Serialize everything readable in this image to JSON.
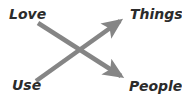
{
  "diagram": {
    "title_visible": false,
    "background_color": "#ffffff",
    "arrow_color": "#858585",
    "label_color": "#2b2b2b",
    "labels": [
      {
        "id": "love",
        "text": "Love",
        "position": "top-left"
      },
      {
        "id": "things",
        "text": "Things",
        "position": "top-right"
      },
      {
        "id": "use",
        "text": "Use",
        "position": "bottom-left"
      },
      {
        "id": "people",
        "text": "People",
        "position": "bottom-right"
      }
    ],
    "arrows": [
      {
        "id": "love-to-people",
        "from": "Love",
        "to": "People",
        "direction": "down-right",
        "start": {
          "x": 38,
          "y": 23
        },
        "end": {
          "x": 126,
          "y": 79
        }
      },
      {
        "id": "use-to-things",
        "from": "Use",
        "to": "Things",
        "direction": "up-right",
        "start": {
          "x": 36,
          "y": 81
        },
        "end": {
          "x": 125,
          "y": 18
        }
      }
    ],
    "crossing_point": {
      "x": 80,
      "y": 50
    }
  }
}
